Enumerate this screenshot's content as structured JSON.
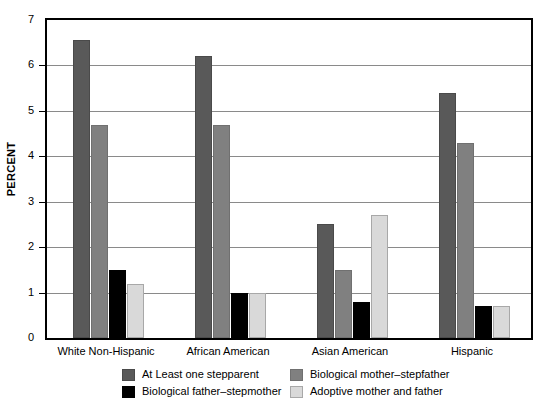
{
  "chart_data": {
    "type": "bar",
    "title": "",
    "xlabel": "",
    "ylabel": "PERCENT",
    "ylim": [
      0,
      7
    ],
    "yticks": [
      0,
      1,
      2,
      3,
      4,
      5,
      6,
      7
    ],
    "ytick_labels": [
      "0",
      "1",
      "2",
      "3",
      "4",
      "5",
      "6",
      "7"
    ],
    "grid": true,
    "legend_position": "bottom",
    "categories": [
      "White Non-Hispanic",
      "African American",
      "Asian American",
      "Hispanic"
    ],
    "series": [
      {
        "name": "At Least one stepparent",
        "color": "#595959",
        "values": [
          6.55,
          6.2,
          2.5,
          5.4
        ]
      },
      {
        "name": "Biological mother–stepfather",
        "color": "#808080",
        "values": [
          4.7,
          4.7,
          1.5,
          4.3
        ]
      },
      {
        "name": "Biological father–stepmother",
        "color": "#000000",
        "values": [
          1.5,
          1.0,
          0.8,
          0.7
        ]
      },
      {
        "name": "Adoptive mother and father",
        "color": "#d9d9d9",
        "values": [
          1.2,
          1.0,
          2.7,
          0.7
        ]
      }
    ]
  },
  "axis": {
    "y_title": "PERCENT"
  },
  "legend": {
    "items": [
      {
        "label": "At Least one stepparent",
        "swatch": "s0"
      },
      {
        "label": "Biological mother–stepfather",
        "swatch": "s1"
      },
      {
        "label": "Biological father–stepmother",
        "swatch": "s2"
      },
      {
        "label": "Adoptive mother and father",
        "swatch": "s3"
      }
    ]
  },
  "caption": {
    "text": ""
  }
}
